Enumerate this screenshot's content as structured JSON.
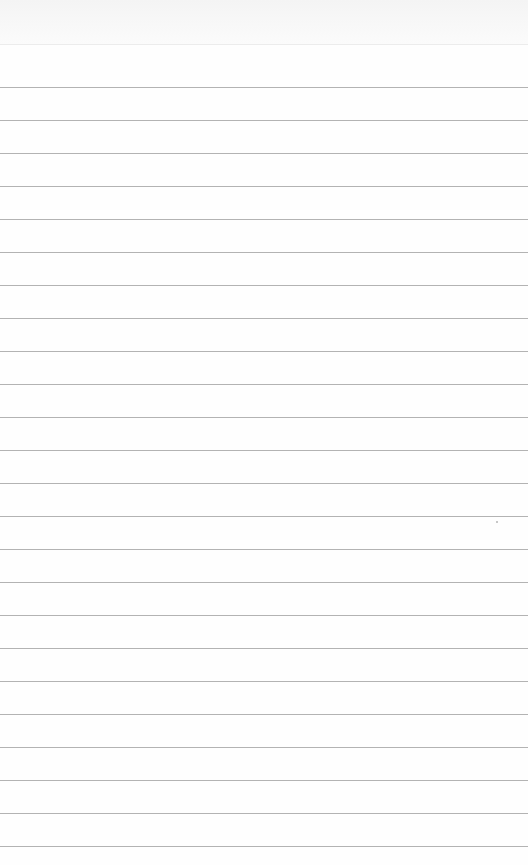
{
  "notepad": {
    "type": "blank ruled paper",
    "header_height": 44,
    "first_rule_y": 87,
    "rule_spacing": 33,
    "rule_count": 24,
    "colors": {
      "paper": "#fefefe",
      "header": "#f4f4f4",
      "rule": "#9a9a9a"
    }
  }
}
